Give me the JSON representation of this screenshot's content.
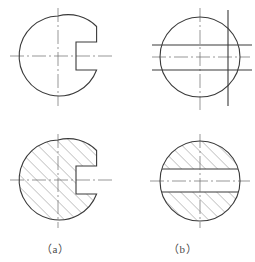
{
  "figure": {
    "kind": "engineering-drawing",
    "stroke_color": "#3a3a3a",
    "centerline_color": "#6b6b6b",
    "hatch_color": "#555555",
    "background_color": "#ffffff",
    "line_width_outline": 1.1,
    "line_width_centerline": 0.7,
    "line_width_hatch": 0.6,
    "hatch_angle_deg": 45,
    "hatch_spacing_px": 6
  },
  "captions": {
    "a": "（a）",
    "b": "（b）"
  },
  "views": {
    "top_left": {
      "name": "outline-view-with-slot",
      "center_x": 58,
      "center_y": 56,
      "radius": 40,
      "hatched": false,
      "slot": {
        "side": "right",
        "opening_x": 98,
        "depth_x": 76,
        "top_y": 42,
        "bottom_y": 70
      },
      "centerlines": {
        "vertical_x": 58,
        "vertical_y1": 8,
        "vertical_y2": 106,
        "horizontal_y": 56,
        "horizontal_x1": 10,
        "horizontal_x2": 112
      }
    },
    "top_right": {
      "name": "outline-view-plain",
      "center_x": 200,
      "center_y": 57,
      "radius": 40,
      "hatched": false,
      "projection_lines": {
        "vertical": [
          228
        ],
        "vertical_y1": 10,
        "vertical_y2": 106,
        "horizontal": [
          45,
          70
        ],
        "horizontal_x1": 152,
        "horizontal_x2": 252
      },
      "centerlines": {
        "vertical_x": 200,
        "vertical_y1": 8,
        "vertical_y2": 112,
        "horizontal_y": 57,
        "horizontal_x1": 152,
        "horizontal_x2": 250
      }
    },
    "bottom_left": {
      "name": "section-view-with-slot",
      "center_x": 58,
      "center_y": 180,
      "radius": 40,
      "hatched": true,
      "slot": {
        "side": "right",
        "opening_x": 98,
        "depth_x": 76,
        "top_y": 166,
        "bottom_y": 194
      },
      "centerlines": {
        "vertical_x": 58,
        "vertical_y1": 134,
        "vertical_y2": 228,
        "horizontal_y": 180,
        "horizontal_x1": 10,
        "horizontal_x2": 112
      }
    },
    "bottom_right": {
      "name": "section-view-with-band",
      "center_x": 200,
      "center_y": 181,
      "radius": 40,
      "hatched": true,
      "unhatched_band": {
        "top_y": 169,
        "bottom_y": 192
      },
      "centerlines": {
        "vertical_x": 200,
        "vertical_y1": 134,
        "vertical_y2": 228,
        "horizontal_y": 181,
        "horizontal_x1": 150,
        "horizontal_x2": 250
      }
    }
  }
}
